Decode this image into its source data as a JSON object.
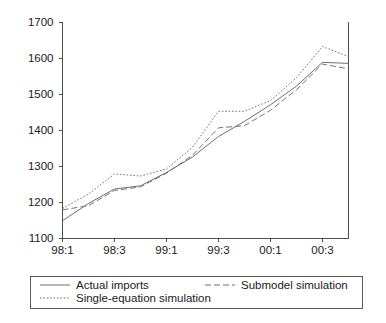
{
  "chart_data": {
    "type": "line",
    "title": "",
    "xlabel": "",
    "ylabel": "",
    "ylim": [
      1100,
      1700
    ],
    "ytick_values": [
      1100,
      1200,
      1300,
      1400,
      1500,
      1600,
      1700
    ],
    "ytick_labels": [
      "1100",
      "1200",
      "1300",
      "1400",
      "1500",
      "1600",
      "1700"
    ],
    "grid": false,
    "legend_position": "below-plot",
    "x": [
      "98:1",
      "98:2",
      "98:3",
      "98:4",
      "99:1",
      "99:2",
      "99:3",
      "99:4",
      "00:1",
      "00:2",
      "00:3",
      "00:4"
    ],
    "xtick_labels": [
      "98:1",
      "98:3",
      "99:1",
      "99:3",
      "00:1",
      "00:3"
    ],
    "xtick_indices": [
      0,
      2,
      4,
      6,
      8,
      10
    ],
    "series": [
      {
        "name": "Actual imports",
        "style": "solid",
        "color": "#6e6e6e",
        "values": [
          1148,
          1196,
          1236,
          1245,
          1282,
          1325,
          1382,
          1424,
          1470,
          1522,
          1588,
          1585
        ]
      },
      {
        "name": "Submodel simulation",
        "style": "dashed",
        "color": "#6e6e6e",
        "values": [
          1178,
          1190,
          1232,
          1242,
          1280,
          1330,
          1406,
          1412,
          1455,
          1512,
          1583,
          1570
        ]
      },
      {
        "name": "Single-equation simulation",
        "style": "dotted",
        "color": "#6e6e6e",
        "values": [
          1182,
          1222,
          1278,
          1272,
          1292,
          1352,
          1452,
          1452,
          1482,
          1545,
          1632,
          1604
        ]
      }
    ]
  },
  "legend": {
    "entries": [
      {
        "label": "Actual imports",
        "style": "solid"
      },
      {
        "label": "Submodel simulation",
        "style": "dashed"
      },
      {
        "label": "Single-equation simulation",
        "style": "dotted"
      }
    ]
  }
}
